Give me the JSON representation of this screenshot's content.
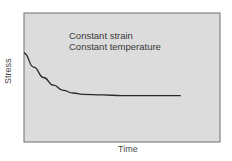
{
  "chart_data": {
    "type": "line",
    "title": "",
    "xlabel": "Time",
    "ylabel": "Stress",
    "annotations": [
      "Constant strain",
      "Constant temperature"
    ],
    "grid": false,
    "legend": null,
    "axis_ticks": "none",
    "series": [
      {
        "name": "Stress relaxation",
        "x": [
          0,
          0.05,
          0.1,
          0.15,
          0.2,
          0.25,
          0.3,
          0.4,
          0.5,
          0.6,
          0.8
        ],
        "values": [
          0.69,
          0.58,
          0.5,
          0.44,
          0.4,
          0.38,
          0.37,
          0.365,
          0.36,
          0.36,
          0.36
        ]
      }
    ],
    "xlim": [
      0,
      1
    ],
    "ylim": [
      0,
      1
    ]
  },
  "colors": {
    "plot_background": "#dcdcdc",
    "plot_border": "#6e6e6e",
    "curve": "#2a2a2a",
    "text": "#3a3a3a"
  }
}
